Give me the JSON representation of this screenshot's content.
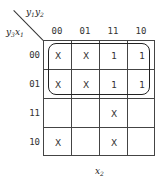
{
  "kmap": {
    "top_var": {
      "a": "y",
      "a_sub": "1",
      "b": "y",
      "b_sub": "2"
    },
    "left_var": {
      "a": "y",
      "a_sub": "3",
      "b": "x",
      "b_sub": "1"
    },
    "bottom_var": {
      "a": "x",
      "a_sub": "2"
    },
    "columns": [
      "00",
      "01",
      "11",
      "10"
    ],
    "rows": [
      "00",
      "01",
      "11",
      "10"
    ],
    "cells": [
      [
        "X",
        "X",
        "1",
        "1"
      ],
      [
        "X",
        "X",
        "1",
        "1"
      ],
      [
        "",
        "",
        "X",
        ""
      ],
      [
        "X",
        "",
        "X",
        ""
      ]
    ],
    "groupings": [
      {
        "rows": [
          "00",
          "01"
        ],
        "columns": [
          "00",
          "01",
          "11",
          "10"
        ],
        "shape": "rounded-rectangle"
      }
    ]
  }
}
